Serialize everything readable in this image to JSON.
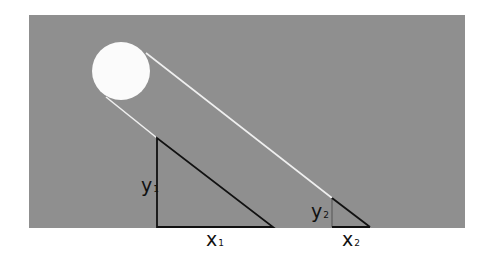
{
  "colors": {
    "background": "#ffffff",
    "panel": "#8f8f8f",
    "sun": "#fbfbfb",
    "ray": "#efefef",
    "triangle_stroke": "#111111",
    "small_vertical_stroke": "#6e6e6e"
  },
  "diagram": {
    "panel": {
      "x": 29,
      "y": 15,
      "width": 436,
      "height": 213
    },
    "sun": {
      "cx": 121,
      "cy": 71,
      "r": 29
    },
    "rays": [
      {
        "x1": 146,
        "y1": 53,
        "x2": 332,
        "y2": 198
      },
      {
        "x1": 106,
        "y1": 97,
        "x2": 157,
        "y2": 138
      }
    ],
    "triangle_large": {
      "apex": [
        157,
        138
      ],
      "base_left": [
        157,
        227
      ],
      "base_right": [
        273,
        227
      ]
    },
    "triangle_small": {
      "apex": [
        332,
        198
      ],
      "base_left": [
        332,
        227
      ],
      "base_right": [
        370,
        227
      ]
    }
  },
  "labels": {
    "y1": {
      "main": "y",
      "sub": "1"
    },
    "x1": {
      "main": "x",
      "sub": "1"
    },
    "y2": {
      "main": "y",
      "sub": "2"
    },
    "x2": {
      "main": "x",
      "sub": "2"
    }
  }
}
